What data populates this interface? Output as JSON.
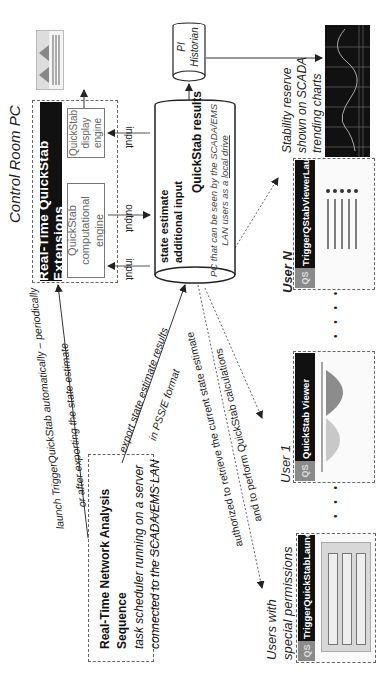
{
  "diagram": {
    "control_room": {
      "title": "Control Room PC",
      "extensions_title": "Real-Time QuickStab Extensions",
      "computational_engine": "QuickStab computational engine",
      "display_engine": "QuickStab display engine",
      "input_label_1": "input",
      "output_label": "output",
      "input_label_2": "input"
    },
    "results_store": {
      "line1": "QuickStab results",
      "line2": "state estimate",
      "line3": "additional input",
      "note_line1": "PC that can be seen by the SCADA/EMS",
      "note_line2_prefix": "LAN users as a ",
      "note_line2_link": "local drive"
    },
    "historian": {
      "line1": "PI",
      "line2": "Historian"
    },
    "scada": {
      "caption_line1": "Stability reserve",
      "caption_line2": "shown on SCADA",
      "caption_line3": "trending charts"
    },
    "scheduler": {
      "line1": "Real-Time Network Analysis Sequence",
      "line2": "task scheduler running on a server",
      "line3": "connected to the SCADA/EMS LAN"
    },
    "edges": {
      "launch_line1": "launch TriggerQuickStab automatically – periodically",
      "launch_line2": "or after exporting the state estimate",
      "export_line1": "export state estimate results",
      "export_line2": "in  PSS/E format",
      "authorized_line1": "authorized to retrieve the current state estimate",
      "authorized_line2": "and to perform QuickStab calculations"
    },
    "users": [
      {
        "label": "Users with special permissions",
        "label_line1": "Users with",
        "label_line2": "special permissions",
        "app_title": "TriggerQuickStabLaunchPad",
        "logo": "QS"
      },
      {
        "label": "User 1",
        "app_title": "QuickStab Viewer",
        "logo": "QS"
      },
      {
        "label": "User N",
        "app_title": "TriggerQStabViewerLaunchPad",
        "logo": "QS"
      }
    ],
    "ellipsis": "• • • •"
  }
}
